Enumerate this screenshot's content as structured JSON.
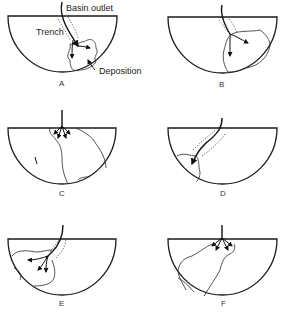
{
  "figure": {
    "annotations": {
      "basin_outlet": "Basin outlet",
      "trench": "Trench",
      "deposition": "Deposition"
    },
    "panels": [
      {
        "id": "A",
        "label": "A"
      },
      {
        "id": "B",
        "label": "B"
      },
      {
        "id": "C",
        "label": "C"
      },
      {
        "id": "D",
        "label": "D"
      },
      {
        "id": "E",
        "label": "E"
      },
      {
        "id": "F",
        "label": "F"
      }
    ]
  }
}
